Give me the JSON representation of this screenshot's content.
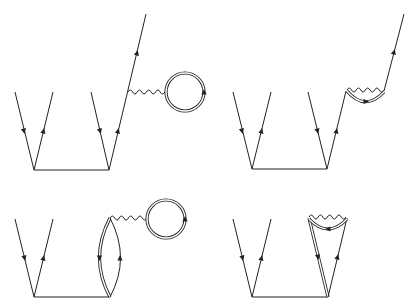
{
  "figure": {
    "line_color": "#222222",
    "background": "#ffffff",
    "diagrams": [
      {
        "id": "top-left",
        "elements": [
          "fermion-pair-left",
          "fermion-pair-right",
          "horizontal-interaction-line",
          "outgoing-fermion",
          "photon-propagator",
          "double-line-loop"
        ]
      },
      {
        "id": "top-right",
        "elements": [
          "fermion-pair-left",
          "fermion-pair-right",
          "horizontal-interaction-line",
          "outgoing-fermion",
          "self-energy-photon",
          "double-line-arc"
        ]
      },
      {
        "id": "bottom-left",
        "elements": [
          "fermion-pair-left",
          "horizontal-interaction-line",
          "lens-double-single-lines",
          "photon-propagator",
          "double-line-loop"
        ]
      },
      {
        "id": "bottom-right",
        "elements": [
          "fermion-pair-left",
          "horizontal-interaction-line",
          "double-line-leg",
          "single-line-leg",
          "vertex-photon",
          "double-line-arc"
        ]
      }
    ]
  }
}
